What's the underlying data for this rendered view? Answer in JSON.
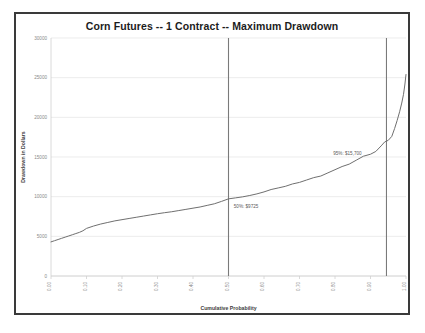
{
  "chart_data": {
    "type": "line",
    "title": "Corn Futures -- 1 Contract -- Maximum Drawdown",
    "xlabel": "Cumulative Probability",
    "ylabel": "Drawdown in Dollars",
    "xlim": [
      0.0,
      1.0
    ],
    "ylim": [
      0,
      30000
    ],
    "grid": true,
    "legend": "none",
    "x_ticks": [
      "0.00",
      "0.10",
      "0.20",
      "0.30",
      "0.40",
      "0.50",
      "0.60",
      "0.70",
      "0.80",
      "0.90",
      "1.00"
    ],
    "x_tick_values": [
      0.0,
      0.1,
      0.2,
      0.3,
      0.4,
      0.5,
      0.6,
      0.7,
      0.8,
      0.9,
      1.0
    ],
    "y_ticks": [
      "0",
      "5000",
      "10000",
      "15000",
      "20000",
      "25000",
      "30000"
    ],
    "y_tick_values": [
      0,
      5000,
      10000,
      15000,
      20000,
      25000,
      30000
    ],
    "series": [
      {
        "name": "Maximum Drawdown",
        "color": "#6f6f6f",
        "x": [
          0.0,
          0.01,
          0.02,
          0.03,
          0.04,
          0.05,
          0.06,
          0.07,
          0.08,
          0.09,
          0.1,
          0.12,
          0.14,
          0.16,
          0.18,
          0.2,
          0.22,
          0.24,
          0.26,
          0.28,
          0.3,
          0.32,
          0.34,
          0.36,
          0.38,
          0.4,
          0.42,
          0.44,
          0.46,
          0.48,
          0.5,
          0.52,
          0.54,
          0.56,
          0.58,
          0.6,
          0.62,
          0.64,
          0.66,
          0.68,
          0.7,
          0.72,
          0.74,
          0.76,
          0.78,
          0.8,
          0.82,
          0.84,
          0.86,
          0.88,
          0.9,
          0.915,
          0.93,
          0.94,
          0.95,
          0.96,
          0.968,
          0.975,
          0.982,
          0.988,
          0.993,
          0.997,
          1.0
        ],
        "y": [
          4300,
          4450,
          4600,
          4750,
          4900,
          5050,
          5200,
          5350,
          5500,
          5700,
          6000,
          6300,
          6550,
          6750,
          6950,
          7100,
          7250,
          7400,
          7550,
          7700,
          7850,
          7980,
          8100,
          8250,
          8400,
          8550,
          8700,
          8900,
          9100,
          9400,
          9725,
          9850,
          9980,
          10150,
          10350,
          10600,
          10900,
          11100,
          11300,
          11600,
          11800,
          12100,
          12400,
          12600,
          13000,
          13400,
          13800,
          14100,
          14600,
          15100,
          15350,
          15700,
          16400,
          16900,
          17100,
          17600,
          18600,
          19600,
          20700,
          21800,
          22900,
          24200,
          25400
        ]
      }
    ],
    "reference_lines": [
      {
        "name": "p50-line",
        "x": 0.5,
        "color": "#7a7a7a",
        "label": "50%: $9725",
        "label_value": 9725,
        "percentile": "50%"
      },
      {
        "name": "p95-line",
        "x": 0.945,
        "color": "#7a7a7a",
        "label": "95%: $15,700",
        "label_value": 15700,
        "percentile": "95%"
      }
    ],
    "annotations": [
      {
        "name": "p50-annotation",
        "text": "50%: $9725",
        "x": 0.515,
        "y": 8550
      },
      {
        "name": "p95-annotation",
        "text": "95%: $15,700",
        "x": 0.795,
        "y": 15300
      }
    ],
    "colors": {
      "line": "#6f6f6f",
      "grid": "#e4e4e4",
      "axis": "#d0d0d0",
      "frame": "#3a3a3a",
      "tick_text": "#8a8a8a",
      "title_text": "#1c1c1c",
      "background": "#ffffff"
    }
  },
  "caption": ""
}
